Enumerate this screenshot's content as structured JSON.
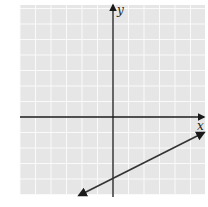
{
  "chart_data": {
    "type": "line",
    "title": "",
    "xlabel": "x",
    "ylabel": "y",
    "grid": true,
    "xlim": [
      -6,
      6
    ],
    "ylim": [
      -5,
      7
    ],
    "series": [
      {
        "name": "line",
        "equation": "y = 0.5x - 4",
        "points": [
          [
            -2,
            -5
          ],
          [
            0,
            -4
          ],
          [
            6,
            -1
          ]
        ],
        "arrows_both_ends": true
      }
    ]
  },
  "labels": {
    "x_axis": "x",
    "y_axis": "y"
  },
  "colors": {
    "grid_bg": "#e6e6e6",
    "grid_line": "#f8f8f8",
    "axis": "#1a1a1a",
    "line": "#333333"
  }
}
